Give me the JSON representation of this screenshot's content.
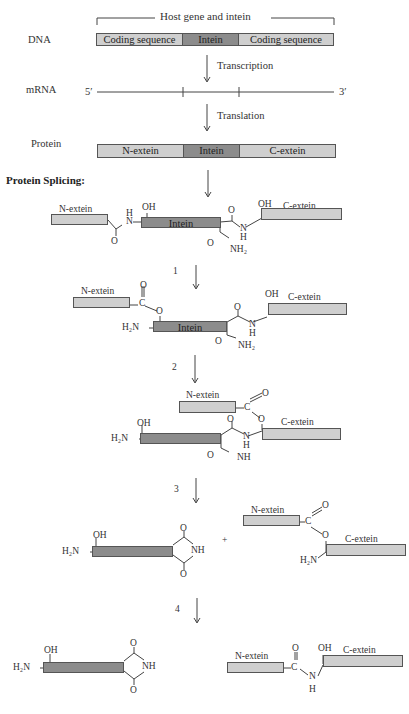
{
  "header": {
    "title_fragment": "...g ... Splicing ..."
  },
  "dna": {
    "row_label": "DNA",
    "bracket_label": "Host gene and intein",
    "segments": [
      "Coding sequence",
      "Intein",
      "Coding sequence"
    ]
  },
  "transcription": {
    "label": "Transcription"
  },
  "mrna": {
    "row_label": "mRNA",
    "five_prime": "5′",
    "three_prime": "3′"
  },
  "translation": {
    "label": "Translation"
  },
  "protein": {
    "row_label": "Protein",
    "segments": [
      "N-extein",
      "Intein",
      "C-extein"
    ]
  },
  "splicing": {
    "heading": "Protein Splicing:",
    "stage0": {
      "n_extein": "N-extein",
      "intein": "Intein",
      "c_extein": "C-extein",
      "oh1": "OH",
      "oh2": "OH",
      "nh_h": "H",
      "nh_n": "N",
      "o1": "O",
      "o2": "O",
      "n2": "N",
      "h2": "H",
      "o3": "O",
      "nh2": "NH₂"
    },
    "step1": "1",
    "stage1": {
      "n_extein": "N-extein",
      "intein": "Intein",
      "c_extein": "C-extein",
      "c": "C",
      "o_dbl": "O",
      "o_link": "O",
      "h2n": "H₂N",
      "oh": "OH",
      "o2": "O",
      "n": "N",
      "h": "H",
      "o3": "O",
      "nh2": "NH₂"
    },
    "step2": "2",
    "stage2": {
      "n_extein": "N-extein",
      "c_extein": "C-extein",
      "c": "C",
      "o_dbl": "O",
      "o_link": "O",
      "h2n": "H₂N",
      "oh": "OH",
      "o2": "O",
      "n": "N",
      "h": "H",
      "o3": "O",
      "nh": "NH"
    },
    "step3": "3",
    "stage3": {
      "h2n": "H₂N",
      "oh": "OH",
      "o_top": "O",
      "nh": "NH",
      "o_bot": "O",
      "plus": "+",
      "n_extein": "N-extein",
      "c_extein": "C-extein",
      "c": "C",
      "o_dbl": "O",
      "o_link": "O",
      "h2n_right": "H₂N"
    },
    "step4": "4",
    "stage4": {
      "h2n": "H₂N",
      "oh": "OH",
      "o_top": "O",
      "nh": "NH",
      "o_bot": "O",
      "n_extein": "N-extein",
      "c_extein": "C-extein",
      "o": "O",
      "c": "C",
      "n": "N",
      "h": "H",
      "oh_right": "OH"
    }
  },
  "colors": {
    "light_box": "#cfcfcf",
    "dark_box": "#8c8c8c",
    "line": "#444444"
  }
}
